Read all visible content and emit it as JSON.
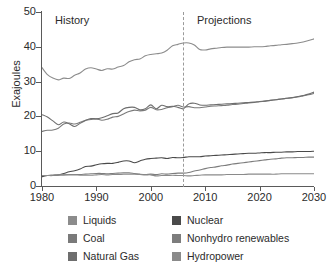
{
  "chart_data": {
    "type": "line",
    "title": "",
    "xlabel": "",
    "ylabel": "Exajoules",
    "xlim": [
      1980,
      2030
    ],
    "ylim": [
      0,
      50
    ],
    "grid": false,
    "legend_position": "bottom",
    "x_ticks": [
      "1980",
      "1990",
      "2000",
      "2010",
      "2020",
      "2030"
    ],
    "x_tick_values": [
      1980,
      1990,
      2000,
      2010,
      2020,
      2030
    ],
    "y_ticks": [
      "0",
      "10",
      "20",
      "30",
      "40",
      "50"
    ],
    "y_tick_values": [
      0,
      10,
      20,
      30,
      40,
      50
    ],
    "annotations": [
      {
        "text": "History",
        "x": 1983
      },
      {
        "text": "Projections",
        "x": 2008
      }
    ],
    "divider_x": 2006,
    "divider_style": "dashed",
    "x": [
      1980,
      1981,
      1982,
      1983,
      1984,
      1985,
      1986,
      1987,
      1988,
      1989,
      1990,
      1991,
      1992,
      1993,
      1994,
      1995,
      1996,
      1997,
      1998,
      1999,
      2000,
      2001,
      2002,
      2003,
      2004,
      2005,
      2006,
      2007,
      2008,
      2009,
      2010,
      2011,
      2012,
      2013,
      2014,
      2015,
      2016,
      2017,
      2018,
      2019,
      2020,
      2021,
      2022,
      2023,
      2024,
      2025,
      2026,
      2027,
      2028,
      2029,
      2030
    ],
    "series": [
      {
        "name": "Liquids",
        "color": "#8c8c8c",
        "values": [
          34.0,
          32.0,
          31.0,
          30.5,
          31.0,
          30.9,
          31.8,
          32.5,
          33.6,
          34.0,
          33.6,
          33.2,
          33.7,
          33.6,
          34.2,
          34.6,
          35.7,
          36.3,
          36.5,
          37.4,
          37.8,
          38.0,
          38.2,
          39.0,
          40.3,
          40.7,
          41.1,
          41.1,
          40.5,
          39.2,
          39.1,
          39.4,
          39.6,
          39.8,
          39.9,
          39.9,
          39.9,
          39.9,
          39.9,
          40.0,
          40.0,
          40.1,
          40.3,
          40.4,
          40.6,
          40.7,
          40.9,
          41.1,
          41.4,
          41.8,
          42.3
        ]
      },
      {
        "name": "Coal",
        "color": "#7a7a7a",
        "values": [
          15.7,
          16.0,
          16.1,
          16.6,
          17.8,
          18.1,
          17.8,
          18.3,
          18.9,
          19.1,
          19.3,
          18.9,
          19.2,
          19.8,
          20.0,
          20.7,
          21.4,
          21.8,
          21.6,
          21.8,
          22.6,
          21.9,
          22.0,
          22.5,
          22.8,
          23.2,
          22.7,
          22.8,
          22.5,
          22.5,
          22.7,
          22.9,
          23.0,
          23.1,
          23.2,
          23.4,
          23.5,
          23.7,
          23.9,
          24.0,
          24.2,
          24.4,
          24.6,
          24.8,
          25.0,
          25.2,
          25.4,
          25.6,
          25.9,
          26.2,
          26.6
        ]
      },
      {
        "name": "Natural Gas",
        "color": "#6e6e6e",
        "values": [
          20.5,
          19.8,
          18.7,
          17.6,
          18.4,
          17.9,
          17.1,
          18.0,
          18.8,
          19.4,
          19.3,
          19.6,
          20.2,
          20.8,
          21.0,
          22.2,
          22.6,
          22.6,
          21.9,
          22.2,
          23.3,
          22.2,
          23.2,
          22.8,
          22.9,
          22.6,
          22.2,
          23.6,
          23.8,
          23.3,
          23.2,
          23.3,
          23.4,
          23.5,
          23.6,
          23.7,
          23.8,
          23.9,
          24.0,
          24.1,
          24.3,
          24.4,
          24.6,
          24.8,
          25.0,
          25.2,
          25.4,
          25.7,
          26.0,
          26.4,
          27.0
        ]
      },
      {
        "name": "Nuclear",
        "color": "#4a4a4a",
        "values": [
          2.7,
          3.0,
          3.1,
          3.2,
          3.6,
          4.1,
          4.4,
          4.9,
          5.6,
          5.7,
          6.1,
          6.4,
          6.5,
          6.5,
          6.8,
          7.2,
          7.2,
          6.7,
          7.2,
          7.7,
          7.9,
          8.0,
          8.1,
          7.9,
          8.2,
          8.1,
          8.2,
          8.4,
          8.4,
          8.4,
          8.6,
          8.7,
          8.8,
          8.9,
          9.0,
          9.1,
          9.2,
          9.3,
          9.4,
          9.4,
          9.5,
          9.6,
          9.6,
          9.7,
          9.7,
          9.8,
          9.8,
          9.9,
          9.9,
          9.9,
          10.0
        ]
      },
      {
        "name": "Nonhydro renewables",
        "color": "#7d7d7d",
        "values": [
          3.0,
          3.0,
          3.0,
          3.1,
          3.2,
          3.3,
          3.3,
          3.3,
          3.4,
          3.5,
          3.6,
          3.6,
          3.5,
          3.6,
          3.7,
          3.8,
          3.8,
          3.6,
          3.4,
          3.3,
          3.4,
          3.3,
          3.5,
          3.4,
          3.6,
          3.7,
          3.7,
          3.9,
          4.3,
          4.6,
          5.0,
          5.3,
          5.5,
          5.8,
          6.0,
          6.3,
          6.5,
          6.7,
          6.9,
          7.1,
          7.3,
          7.5,
          7.7,
          7.8,
          8.0,
          8.1,
          8.1,
          8.2,
          8.2,
          8.3,
          8.3
        ]
      },
      {
        "name": "Hydropower",
        "color": "#8a8a8a",
        "values": [
          3.0,
          3.0,
          3.1,
          3.2,
          3.2,
          3.2,
          3.2,
          3.1,
          3.1,
          3.1,
          3.2,
          3.3,
          3.2,
          3.3,
          3.3,
          3.4,
          3.4,
          3.4,
          3.3,
          3.2,
          3.2,
          2.9,
          3.0,
          3.0,
          3.1,
          3.0,
          3.0,
          2.9,
          3.0,
          3.1,
          3.2,
          3.2,
          3.2,
          3.2,
          3.3,
          3.3,
          3.3,
          3.3,
          3.4,
          3.4,
          3.4,
          3.4,
          3.4,
          3.4,
          3.5,
          3.5,
          3.5,
          3.5,
          3.5,
          3.5,
          3.5
        ]
      }
    ]
  },
  "legend": {
    "columns": [
      {
        "items": [
          {
            "label": "Liquids",
            "color": "#8c8c8c"
          },
          {
            "label": "Coal",
            "color": "#7a7a7a"
          },
          {
            "label": "Natural Gas",
            "color": "#6e6e6e"
          }
        ]
      },
      {
        "items": [
          {
            "label": "Nuclear",
            "color": "#4a4a4a"
          },
          {
            "label": "Nonhydro renewables",
            "color": "#7d7d7d"
          },
          {
            "label": "Hydropower",
            "color": "#8a8a8a"
          }
        ]
      }
    ]
  }
}
